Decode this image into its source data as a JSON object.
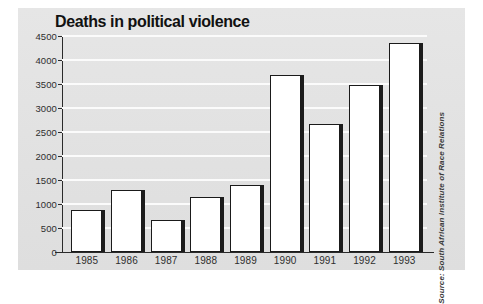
{
  "chart_data": {
    "type": "bar",
    "title": "Deaths in political violence",
    "xlabel": "",
    "ylabel": "",
    "categories": [
      "1985",
      "1986",
      "1987",
      "1988",
      "1989",
      "1990",
      "1991",
      "1992",
      "1993"
    ],
    "values": [
      870,
      1300,
      660,
      1150,
      1400,
      3690,
      2670,
      3480,
      4360
    ],
    "ylim": [
      0,
      4500
    ],
    "yticks": [
      0,
      500,
      1000,
      1500,
      2000,
      2500,
      3000,
      3500,
      4000,
      4500
    ],
    "ytick_labels": [
      "0",
      "500",
      "1000",
      "1500",
      "2000",
      "2500",
      "3000",
      "3500",
      "4000",
      "4500"
    ],
    "grid": true,
    "gridline_color": "#fbfbfb",
    "legend": null,
    "annotations": [
      "Source: South African Institute of Race Relations"
    ]
  },
  "figure": {
    "title": "Deaths in political violence",
    "source_note": "Source: South African Institute of Race Relations",
    "panel_color": "#e3e3e3",
    "bar_fill": "#ffffff",
    "bar_outline": "#1a1a1a",
    "bar_shadow": "#1c1c1c",
    "axis_color": "#2a2a2a",
    "text_color": "#2e2e2e",
    "background": "#ffffff"
  }
}
